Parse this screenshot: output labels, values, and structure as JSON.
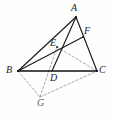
{
  "figure": {
    "width": 113,
    "height": 120,
    "background_color": "#fefefe",
    "solid_stroke_color": "#1a1a1a",
    "dashed_stroke_color": "#9a9a9a"
  },
  "points": {
    "A": {
      "label": "A",
      "x": 76,
      "y": 17,
      "label_x": 71,
      "label_y": 3,
      "style": "solid"
    },
    "B": {
      "label": "B",
      "x": 18,
      "y": 71,
      "label_x": 6,
      "label_y": 65,
      "style": "solid"
    },
    "C": {
      "label": "C",
      "x": 97,
      "y": 71,
      "label_x": 99,
      "label_y": 65,
      "style": "solid"
    },
    "D": {
      "label": "D",
      "x": 52,
      "y": 71,
      "label_x": 50,
      "label_y": 73,
      "style": "solid"
    },
    "E": {
      "label": "E",
      "x": 57,
      "y": 47,
      "label_x": 50,
      "label_y": 38,
      "style": "solid"
    },
    "F": {
      "label": "F",
      "x": 83,
      "y": 37,
      "label_x": 84,
      "label_y": 26,
      "style": "solid"
    },
    "G": {
      "label": "G",
      "x": 40,
      "y": 97,
      "label_x": 37,
      "label_y": 98,
      "style": "dashed"
    }
  },
  "edges": [
    {
      "name": "segment-AB",
      "from": "A",
      "to": "B",
      "style": "solid"
    },
    {
      "name": "segment-AC",
      "from": "A",
      "to": "C",
      "style": "solid"
    },
    {
      "name": "segment-BC",
      "from": "B",
      "to": "C",
      "style": "solid-heavy"
    },
    {
      "name": "segment-AD",
      "from": "A",
      "to": "D",
      "style": "solid"
    },
    {
      "name": "segment-BF",
      "from": "B",
      "to": "F",
      "style": "solid"
    },
    {
      "name": "segment-BG",
      "from": "B",
      "to": "G",
      "style": "dashed"
    },
    {
      "name": "segment-GC",
      "from": "G",
      "to": "C",
      "style": "dashed"
    },
    {
      "name": "segment-GE",
      "from": "G",
      "to": "E",
      "style": "dashed"
    },
    {
      "name": "segment-EC",
      "from": "E",
      "to": "C",
      "style": "dashed"
    }
  ]
}
